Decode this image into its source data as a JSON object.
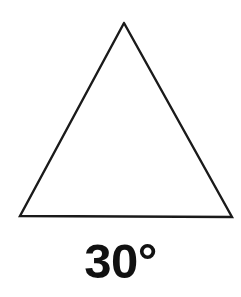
{
  "figure": {
    "background_color": "#ffffff",
    "stroke_color": "#1a1a1a",
    "text_color": "#111111",
    "width": 241,
    "height": 297,
    "caption": "30°",
    "caption_value": "30",
    "caption_unit": "°",
    "shape_name": "triangle",
    "stroke_width": 2.4,
    "vertices": {
      "apex": {
        "x": 124,
        "y": 23
      },
      "bottom_left": {
        "x": 20,
        "y": 217
      },
      "bottom_right": {
        "x": 232,
        "y": 217
      }
    },
    "points_path": "124,23 232,217 20,216 124,23"
  }
}
